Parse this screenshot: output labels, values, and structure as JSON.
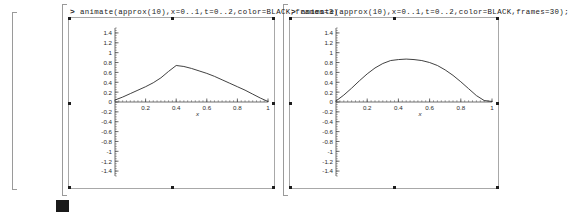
{
  "application": "Maple worksheet",
  "cells": [
    {
      "id": "cell-left",
      "prompt": ">",
      "command": "animate(approx(10),x=0..1,t=0..2,color=BLACK,frames=3)",
      "plot": {
        "name": "animation-frame-left"
      }
    },
    {
      "id": "cell-right",
      "prompt": ">",
      "command": "animate(approx(10),x=0..1,t=0..2,color=BLACK,frames=30);",
      "plot": {
        "name": "animation-frame-right"
      }
    }
  ],
  "colors": {
    "curve": "#2b2b2b",
    "axis": "#4a4a4a",
    "frame": "#a8a8a8",
    "bracket": "#9a9a9a",
    "text": "#1a1a1a",
    "cursor": "#1a1a1a"
  },
  "cursor": {
    "label": "text-cursor-block"
  },
  "chart_data": [
    {
      "type": "line",
      "title": "",
      "xlabel": "x",
      "ylabel": "",
      "xlim": [
        0,
        1
      ],
      "ylim": [
        -1.5,
        1.5
      ],
      "grid": false,
      "legend": "none",
      "xticks": [
        0.2,
        0.4,
        0.6,
        0.8,
        1
      ],
      "xticklabels": [
        "0.2",
        "0.4",
        "0.6",
        "0.8",
        "1"
      ],
      "yticks": [
        1.4,
        1.2,
        1,
        0.8,
        0.6,
        0.4,
        0.2,
        0,
        -0.2,
        -0.4,
        -0.6,
        -0.8,
        -1,
        -1.2,
        -1.4
      ],
      "yticklabels": [
        "1.4",
        "1.2",
        "1",
        "0.8",
        "0.6",
        "0.4",
        "0.2",
        "0",
        "-0.2",
        "-0.4",
        "-0.6",
        "-0.8",
        "-1",
        "-1.2",
        "-1.4"
      ],
      "series": [
        {
          "name": "approx(10) frame 1",
          "x": [
            0.0,
            0.05,
            0.1,
            0.15,
            0.2,
            0.25,
            0.3,
            0.35,
            0.4,
            0.45,
            0.5,
            0.55,
            0.6,
            0.65,
            0.7,
            0.75,
            0.8,
            0.85,
            0.9,
            0.95,
            1.0
          ],
          "y": [
            0.04,
            0.1,
            0.17,
            0.24,
            0.31,
            0.39,
            0.49,
            0.62,
            0.74,
            0.72,
            0.68,
            0.63,
            0.58,
            0.52,
            0.45,
            0.38,
            0.31,
            0.24,
            0.16,
            0.08,
            0.01
          ]
        }
      ]
    },
    {
      "type": "line",
      "title": "",
      "xlabel": "x",
      "ylabel": "",
      "xlim": [
        0,
        1
      ],
      "ylim": [
        -1.5,
        1.5
      ],
      "grid": false,
      "legend": "none",
      "xticks": [
        0.2,
        0.4,
        0.6,
        0.8,
        1
      ],
      "xticklabels": [
        "0.2",
        "0.4",
        "0.6",
        "0.8",
        "1"
      ],
      "yticks": [
        1.4,
        1.2,
        1,
        0.8,
        0.6,
        0.4,
        0.2,
        0,
        -0.2,
        -0.4,
        -0.6,
        -0.8,
        -1,
        -1.2,
        -1.4
      ],
      "yticklabels": [
        "1.4",
        "1.2",
        "1",
        "0.8",
        "0.6",
        "0.4",
        "0.2",
        "0",
        "-0.2",
        "-0.4",
        "-0.6",
        "-0.8",
        "-1",
        "-1.2",
        "-1.4"
      ],
      "series": [
        {
          "name": "approx(10) frame 30",
          "x": [
            0.0,
            0.05,
            0.1,
            0.15,
            0.2,
            0.25,
            0.3,
            0.35,
            0.4,
            0.45,
            0.5,
            0.55,
            0.6,
            0.65,
            0.7,
            0.75,
            0.8,
            0.85,
            0.9,
            0.95,
            1.0
          ],
          "y": [
            0.02,
            0.14,
            0.28,
            0.43,
            0.57,
            0.69,
            0.78,
            0.84,
            0.86,
            0.87,
            0.86,
            0.84,
            0.8,
            0.74,
            0.65,
            0.54,
            0.41,
            0.27,
            0.13,
            0.03,
            0.01
          ]
        }
      ]
    }
  ]
}
